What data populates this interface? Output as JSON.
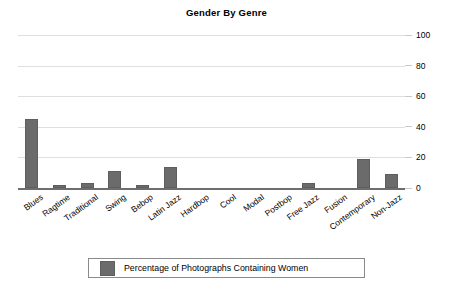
{
  "chart_data": {
    "type": "bar",
    "title": "Gender By Genre",
    "xlabel": "",
    "ylabel": "",
    "ylim": [
      0,
      100
    ],
    "yticks": [
      0,
      20,
      40,
      60,
      80,
      100
    ],
    "grid": true,
    "y_axis_position": "right",
    "legend_position": "bottom",
    "categories": [
      "Blues",
      "Ragtime",
      "Traditional",
      "Swing",
      "Bebop",
      "Latin Jazz",
      "Hardbop",
      "Cool",
      "Modal",
      "Postbop",
      "Free Jazz",
      "Fusion",
      "Contemporary",
      "Non-Jazz"
    ],
    "series": [
      {
        "name": "Percentage of Photographs Containing Women",
        "color": "#6b6b6b",
        "values": [
          45,
          2,
          3,
          11,
          2,
          14,
          0,
          0,
          0,
          0,
          3,
          0,
          19,
          9
        ]
      }
    ]
  },
  "legend": {
    "entries": [
      {
        "label": "Percentage of Photographs Containing Women",
        "color": "#6b6b6b"
      }
    ]
  },
  "colors": {
    "bar": "#6b6b6b",
    "gridline": "#dfdfdf",
    "axis": "#6e6e6e",
    "text": "#000000",
    "background": "#ffffff"
  }
}
